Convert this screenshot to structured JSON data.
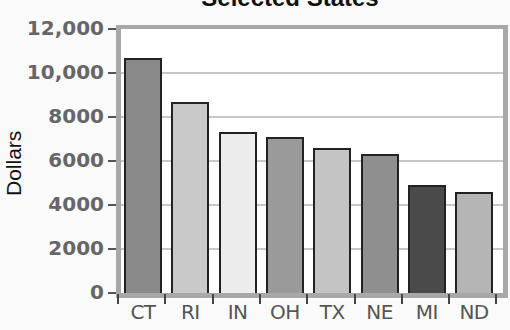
{
  "chart_data": {
    "type": "bar",
    "title": "Selected States",
    "xlabel": "",
    "ylabel": "Dollars",
    "ylim": [
      0,
      12000
    ],
    "yticks": [
      "0",
      "2000",
      "4000",
      "6000",
      "8000",
      "10,000",
      "12,000"
    ],
    "grid": true,
    "categories": [
      "CT",
      "RI",
      "IN",
      "OH",
      "TX",
      "NE",
      "MI",
      "ND"
    ],
    "values": [
      10700,
      8700,
      7300,
      7100,
      6600,
      6300,
      4900,
      4600
    ],
    "bar_colors": [
      "#8a8a8a",
      "#c9c9c9",
      "#ececec",
      "#9a9a9a",
      "#c4c4c4",
      "#8f8f8f",
      "#4a4a4a",
      "#b5b5b5"
    ]
  },
  "ui": {
    "title": "Selected States",
    "ylabel": "Dollars"
  }
}
